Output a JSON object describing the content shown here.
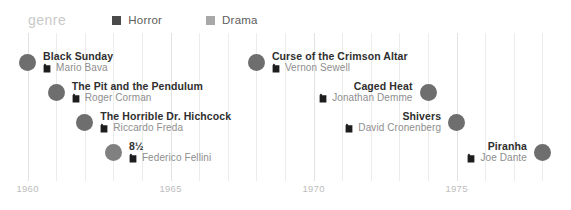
{
  "legend": {
    "title": "genre",
    "items": [
      {
        "label": "Horror",
        "color": "#4a4a4a",
        "swatch_icon": "square-swatch"
      },
      {
        "label": "Drama",
        "color": "#a8a8a8",
        "swatch_icon": "square-swatch"
      }
    ]
  },
  "axis": {
    "ticks": [
      {
        "label": "1960",
        "year": 1960
      },
      {
        "label": "1965",
        "year": 1965
      },
      {
        "label": "1970",
        "year": 1970
      },
      {
        "label": "1975",
        "year": 1975
      }
    ],
    "minor_years": [
      1961,
      1962,
      1963,
      1964,
      1966,
      1967,
      1968,
      1969,
      1971,
      1972,
      1973,
      1974,
      1976,
      1977,
      1978,
      1979
    ],
    "range": [
      1959.0,
      1979.0
    ]
  },
  "chart_data": {
    "type": "scatter",
    "title": "",
    "xlabel": "",
    "ylabel": "",
    "xlim": [
      1959,
      1979
    ],
    "grid": true,
    "legend_position": "top-left",
    "series": [
      {
        "name": "Horror",
        "color": "#4a4a4a"
      },
      {
        "name": "Drama",
        "color": "#a8a8a8"
      }
    ],
    "points": [
      {
        "title": "Black Sunday",
        "director": "Mario Bava",
        "year": 1960,
        "genre": "Horror",
        "dot_color": "#6e6e6e",
        "align": "left",
        "row": 0
      },
      {
        "title": "The Pit and the Pendulum",
        "director": "Roger Corman",
        "year": 1961,
        "genre": "Horror",
        "dot_color": "#6e6e6e",
        "align": "left",
        "row": 1
      },
      {
        "title": "The Horrible Dr. Hichcock",
        "director": "Riccardo Freda",
        "year": 1962,
        "genre": "Horror",
        "dot_color": "#6e6e6e",
        "align": "left",
        "row": 2
      },
      {
        "title": "8½",
        "director": "Federico Fellini",
        "year": 1963,
        "genre": "Drama",
        "dot_color": "#808080",
        "align": "left",
        "row": 3
      },
      {
        "title": "Curse of the Crimson Altar",
        "director": "Vernon Sewell",
        "year": 1968,
        "genre": "Horror",
        "dot_color": "#6e6e6e",
        "align": "left",
        "row": 0
      },
      {
        "title": "Caged Heat",
        "director": "Jonathan Demme",
        "year": 1974,
        "genre": "Drama",
        "dot_color": "#6e6e6e",
        "align": "right",
        "row": 1
      },
      {
        "title": "Shivers",
        "director": "David Cronenberg",
        "year": 1975,
        "genre": "Horror",
        "dot_color": "#6e6e6e",
        "align": "right",
        "row": 2
      },
      {
        "title": "Piranha",
        "director": "Joe Dante",
        "year": 1978,
        "genre": "Horror",
        "dot_color": "#6e6e6e",
        "align": "right",
        "row": 3
      }
    ]
  }
}
